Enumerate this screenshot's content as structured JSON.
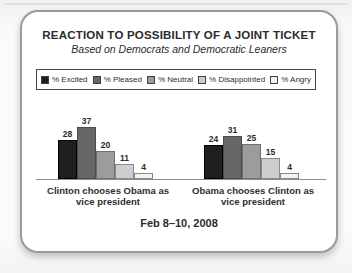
{
  "chart_data": {
    "type": "bar",
    "title": "REACTION TO POSSIBILITY OF A JOINT TICKET",
    "subtitle": "Based on Democrats and Democratic Leaners",
    "date_label": "Feb 8–10, 2008",
    "unit": "%",
    "ylim": [
      0,
      40
    ],
    "grid": false,
    "y_axis_shown": false,
    "value_labels": true,
    "legend_position": "top",
    "series": [
      {
        "name": "% Excited",
        "color": "#1f1f1f",
        "border": "#000000"
      },
      {
        "name": "% Pleased",
        "color": "#666666",
        "border": "#4a4a4a"
      },
      {
        "name": "% Neutral",
        "color": "#9c9c9c",
        "border": "#6f6f6f"
      },
      {
        "name": "% Disappointed",
        "color": "#cecece",
        "border": "#8a8a8a"
      },
      {
        "name": "% Angry",
        "color": "#f3f3f1",
        "border": "#8a8a8a"
      }
    ],
    "categories": [
      "Clinton chooses Obama as vice president",
      "Obama chooses Clinton as vice president"
    ],
    "groups": [
      {
        "label": "Clinton chooses Obama as vice president",
        "label_lines": [
          "Clinton chooses Obama as",
          "vice president"
        ],
        "values": [
          28,
          37,
          20,
          11,
          4
        ]
      },
      {
        "label": "Obama chooses Clinton as vice president",
        "label_lines": [
          "Obama chooses Clinton as",
          "vice president"
        ],
        "values": [
          24,
          31,
          25,
          15,
          4
        ]
      }
    ]
  }
}
